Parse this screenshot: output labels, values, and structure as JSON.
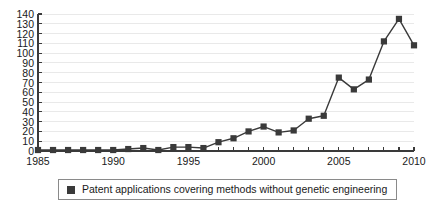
{
  "chart_data": {
    "type": "line",
    "title": "",
    "xlabel": "",
    "ylabel": "",
    "xlim": [
      1985,
      2010
    ],
    "ylim": [
      0,
      140
    ],
    "grid": true,
    "legend_position": "bottom",
    "y_ticks": [
      0,
      10,
      20,
      30,
      40,
      50,
      60,
      70,
      80,
      90,
      100,
      110,
      120,
      130,
      140
    ],
    "x_ticks": [
      1985,
      1986,
      1987,
      1988,
      1989,
      1990,
      1991,
      1992,
      1993,
      1994,
      1995,
      1996,
      1997,
      1998,
      1999,
      2000,
      2001,
      2002,
      2003,
      2004,
      2005,
      2006,
      2007,
      2008,
      2009,
      2010
    ],
    "x_tick_labels": [
      "1985",
      "1990",
      "1995",
      "2000",
      "2005",
      "2010"
    ],
    "x_labeled_ticks": [
      1985,
      1990,
      1995,
      2000,
      2005,
      2010
    ],
    "x": [
      1985,
      1986,
      1987,
      1988,
      1989,
      1990,
      1991,
      1992,
      1993,
      1994,
      1995,
      1996,
      1997,
      1998,
      1999,
      2000,
      2001,
      2002,
      2003,
      2004,
      2005,
      2006,
      2007,
      2008,
      2009,
      2010
    ],
    "series": [
      {
        "name": "Patent applications covering methods without genetic engineering",
        "color": "#3a3a3a",
        "marker": "square",
        "values": [
          1,
          1,
          1,
          1,
          1,
          1,
          2,
          3,
          1,
          4,
          4,
          3,
          9,
          13,
          20,
          25,
          19,
          21,
          33,
          36,
          75,
          63,
          73,
          112,
          135,
          108
        ]
      }
    ],
    "legend": [
      {
        "label": "Patent applications covering methods without genetic engineering",
        "swatch_color": "#3a3a3a",
        "marker": "square"
      }
    ]
  }
}
